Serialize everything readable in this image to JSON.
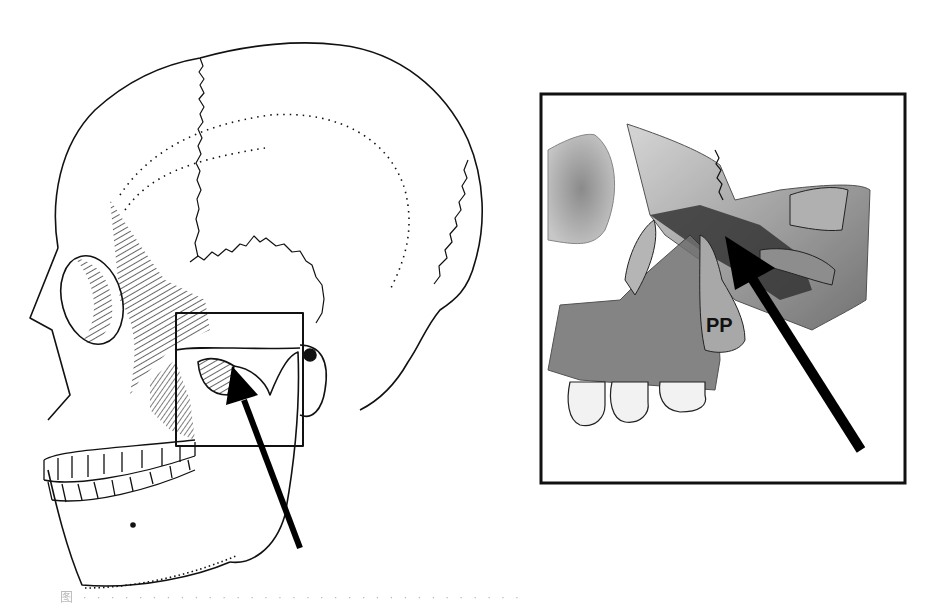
{
  "figure": {
    "type": "anatomical illustration",
    "left_panel": {
      "subject": "lateral view of skull",
      "highlight_box": "region of pterygopalatine fossa",
      "arrow": "points to highlighted region"
    },
    "right_panel": {
      "subject": "magnified inset of maxilla / pterygopalatine region",
      "labels": [
        {
          "text": "PP"
        }
      ],
      "arrow": "points into fossa"
    },
    "caption": "图 · · ·  ·  · · · · · · · ·  · · · · · ·  · · · · · · · ·  · · · · · ·"
  },
  "colors": {
    "line": "#111111",
    "shade_dark": "#3a3a3a",
    "shade_mid": "#8a8a8a",
    "shade_light": "#c9c9c9",
    "background": "#ffffff"
  }
}
